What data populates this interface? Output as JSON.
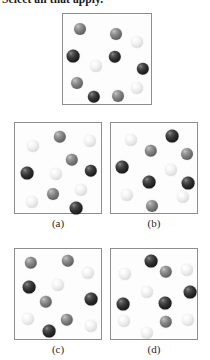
{
  "stem": {
    "text": "Select all that apply."
  },
  "colors": {
    "dark": "#1d1d1d",
    "mid": "#7c7c7c",
    "light": "#f2f2f2",
    "box_border": "#8d8d90",
    "background": "#ffffff"
  },
  "legend": {
    "dark_label": "dark sphere",
    "mid_label": "gray sphere",
    "light_label": "white sphere"
  },
  "panels": [
    {
      "id": "reference",
      "caption": "",
      "box": {
        "x": 62,
        "y": 13,
        "w": 90,
        "h": 92
      },
      "counts": {
        "dark": 4,
        "mid": 5,
        "light": 2
      },
      "spheres": [
        {
          "cx": 17,
          "cy": 15,
          "r": 6.0,
          "shade": "mid"
        },
        {
          "cx": 53,
          "cy": 20,
          "r": 6.0,
          "shade": "mid"
        },
        {
          "cx": 74,
          "cy": 28,
          "r": 6.0,
          "shade": "light"
        },
        {
          "cx": 10,
          "cy": 42,
          "r": 6.4,
          "shade": "dark"
        },
        {
          "cx": 52,
          "cy": 43,
          "r": 6.2,
          "shade": "dark"
        },
        {
          "cx": 33,
          "cy": 52,
          "r": 6.0,
          "shade": "light"
        },
        {
          "cx": 80,
          "cy": 55,
          "r": 6.2,
          "shade": "dark"
        },
        {
          "cx": 14,
          "cy": 69,
          "r": 6.0,
          "shade": "mid"
        },
        {
          "cx": 74,
          "cy": 74,
          "r": 6.0,
          "shade": "light"
        },
        {
          "cx": 31,
          "cy": 83,
          "r": 6.2,
          "shade": "dark"
        },
        {
          "cx": 55,
          "cy": 82,
          "r": 6.0,
          "shade": "mid"
        }
      ]
    },
    {
      "id": "a",
      "caption": "(a)",
      "box": {
        "x": 14,
        "y": 122,
        "w": 88,
        "h": 92
      },
      "counts": {
        "dark": 3,
        "mid": 3,
        "light": 5
      },
      "spheres": [
        {
          "cx": 45,
          "cy": 14,
          "r": 6.2,
          "shade": "mid"
        },
        {
          "cx": 75,
          "cy": 18,
          "r": 6.0,
          "shade": "light"
        },
        {
          "cx": 18,
          "cy": 23,
          "r": 6.0,
          "shade": "light"
        },
        {
          "cx": 57,
          "cy": 37,
          "r": 6.2,
          "shade": "mid"
        },
        {
          "cx": 12,
          "cy": 50,
          "r": 6.4,
          "shade": "dark"
        },
        {
          "cx": 41,
          "cy": 51,
          "r": 6.0,
          "shade": "light"
        },
        {
          "cx": 76,
          "cy": 48,
          "r": 6.2,
          "shade": "dark"
        },
        {
          "cx": 66,
          "cy": 67,
          "r": 6.0,
          "shade": "light"
        },
        {
          "cx": 38,
          "cy": 71,
          "r": 6.0,
          "shade": "mid"
        },
        {
          "cx": 17,
          "cy": 79,
          "r": 6.0,
          "shade": "light"
        },
        {
          "cx": 61,
          "cy": 85,
          "r": 6.4,
          "shade": "dark"
        }
      ]
    },
    {
      "id": "b",
      "caption": "(b)",
      "box": {
        "x": 110,
        "y": 122,
        "w": 88,
        "h": 92
      },
      "counts": {
        "dark": 4,
        "mid": 3,
        "light": 4
      },
      "spheres": [
        {
          "cx": 20,
          "cy": 17,
          "r": 6.0,
          "shade": "light"
        },
        {
          "cx": 61,
          "cy": 13,
          "r": 6.4,
          "shade": "dark"
        },
        {
          "cx": 40,
          "cy": 28,
          "r": 6.2,
          "shade": "mid"
        },
        {
          "cx": 76,
          "cy": 31,
          "r": 6.0,
          "shade": "mid"
        },
        {
          "cx": 11,
          "cy": 44,
          "r": 6.4,
          "shade": "dark"
        },
        {
          "cx": 60,
          "cy": 47,
          "r": 6.0,
          "shade": "light"
        },
        {
          "cx": 38,
          "cy": 59,
          "r": 6.4,
          "shade": "dark"
        },
        {
          "cx": 77,
          "cy": 60,
          "r": 6.4,
          "shade": "dark"
        },
        {
          "cx": 16,
          "cy": 72,
          "r": 6.0,
          "shade": "light"
        },
        {
          "cx": 72,
          "cy": 74,
          "r": 6.0,
          "shade": "light"
        },
        {
          "cx": 41,
          "cy": 83,
          "r": 6.0,
          "shade": "mid"
        }
      ]
    },
    {
      "id": "c",
      "caption": "(c)",
      "box": {
        "x": 14,
        "y": 248,
        "w": 88,
        "h": 92
      },
      "counts": {
        "dark": 3,
        "mid": 4,
        "light": 4
      },
      "spheres": [
        {
          "cx": 16,
          "cy": 14,
          "r": 6.2,
          "shade": "mid"
        },
        {
          "cx": 53,
          "cy": 12,
          "r": 6.2,
          "shade": "mid"
        },
        {
          "cx": 73,
          "cy": 24,
          "r": 6.0,
          "shade": "light"
        },
        {
          "cx": 14,
          "cy": 38,
          "r": 6.4,
          "shade": "dark"
        },
        {
          "cx": 43,
          "cy": 36,
          "r": 6.0,
          "shade": "light"
        },
        {
          "cx": 31,
          "cy": 53,
          "r": 6.2,
          "shade": "mid"
        },
        {
          "cx": 76,
          "cy": 50,
          "r": 6.4,
          "shade": "dark"
        },
        {
          "cx": 13,
          "cy": 70,
          "r": 6.0,
          "shade": "light"
        },
        {
          "cx": 52,
          "cy": 71,
          "r": 6.2,
          "shade": "mid"
        },
        {
          "cx": 76,
          "cy": 77,
          "r": 6.0,
          "shade": "light"
        },
        {
          "cx": 34,
          "cy": 82,
          "r": 6.4,
          "shade": "dark"
        }
      ]
    },
    {
      "id": "d",
      "caption": "(d)",
      "box": {
        "x": 110,
        "y": 248,
        "w": 88,
        "h": 92
      },
      "counts": {
        "dark": 4,
        "mid": 3,
        "light": 5
      },
      "spheres": [
        {
          "cx": 40,
          "cy": 12,
          "r": 6.4,
          "shade": "dark"
        },
        {
          "cx": 14,
          "cy": 25,
          "r": 6.0,
          "shade": "light"
        },
        {
          "cx": 55,
          "cy": 23,
          "r": 6.2,
          "shade": "mid"
        },
        {
          "cx": 76,
          "cy": 21,
          "r": 6.0,
          "shade": "light"
        },
        {
          "cx": 36,
          "cy": 43,
          "r": 6.0,
          "shade": "light"
        },
        {
          "cx": 79,
          "cy": 43,
          "r": 6.4,
          "shade": "dark"
        },
        {
          "cx": 12,
          "cy": 55,
          "r": 6.4,
          "shade": "dark"
        },
        {
          "cx": 54,
          "cy": 54,
          "r": 6.4,
          "shade": "dark"
        },
        {
          "cx": 13,
          "cy": 72,
          "r": 6.0,
          "shade": "light"
        },
        {
          "cx": 77,
          "cy": 71,
          "r": 6.0,
          "shade": "light"
        },
        {
          "cx": 55,
          "cy": 73,
          "r": 6.2,
          "shade": "mid"
        },
        {
          "cx": 36,
          "cy": 84,
          "r": 6.0,
          "shade": "light"
        }
      ]
    }
  ]
}
